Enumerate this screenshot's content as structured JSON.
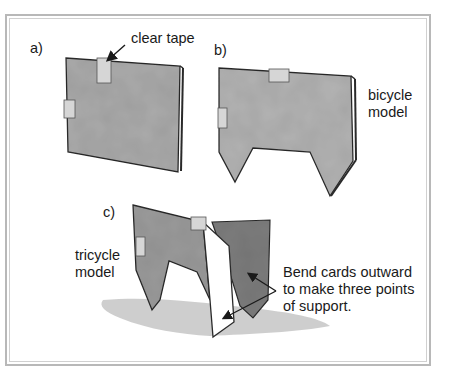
{
  "figure": {
    "panels": [
      {
        "id": "a",
        "label": "a)",
        "callout": "clear tape"
      },
      {
        "id": "b",
        "label": "b)",
        "caption_lines": [
          "bicycle",
          "model"
        ]
      },
      {
        "id": "c",
        "label": "c)",
        "caption_lines": [
          "tricycle",
          "model"
        ],
        "callout_lines": [
          "Bend cards outward",
          "to make three points",
          "of support."
        ]
      }
    ],
    "colors": {
      "frame": "#b8b8b8",
      "card_fill": "#a9a9a9",
      "card_fill_light": "#c4c4c4",
      "card_dark": "#7d7d7d",
      "outline": "#2a2a2a",
      "tape": "#d6d6d6",
      "shadow": "#c9c9c9"
    }
  }
}
